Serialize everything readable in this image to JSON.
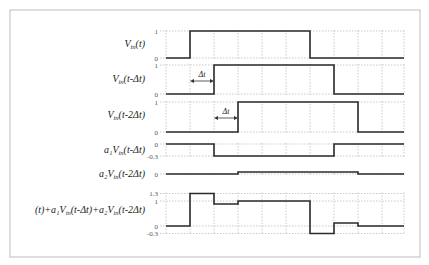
{
  "figure": {
    "frame": {
      "x": 10,
      "y": 10,
      "w": 410,
      "h": 247
    },
    "grid_x": [
      166,
      190,
      214,
      238,
      262,
      286,
      310,
      334,
      358,
      382,
      404
    ],
    "x_start": 166,
    "x_end": 404,
    "step_width": 24,
    "delta_t_label": "Δt"
  },
  "signals": [
    {
      "name": "vin-t",
      "label": {
        "prefix": "",
        "main": "V",
        "sub": "in",
        "rest": "(t)"
      },
      "label_y": 47,
      "ticks": [
        {
          "text": "1",
          "value": 1
        },
        {
          "text": "0",
          "value": 0
        }
      ],
      "y_map": {
        "v1": 1,
        "y1": 31,
        "v0": 0,
        "y0": 58
      },
      "points": [
        [
          166,
          0
        ],
        [
          190,
          0
        ],
        [
          190,
          1
        ],
        [
          310,
          1
        ],
        [
          310,
          0
        ],
        [
          404,
          0
        ]
      ]
    },
    {
      "name": "vin-t-minus-dt",
      "label": {
        "prefix": "",
        "main": "V",
        "sub": "in",
        "rest": "(t-Δt)"
      },
      "label_y": 82,
      "ticks": [
        {
          "text": "1",
          "value": 1
        },
        {
          "text": "0",
          "value": 0
        }
      ],
      "y_map": {
        "v1": 1,
        "y1": 65,
        "v0": 0,
        "y0": 94
      },
      "points": [
        [
          166,
          0
        ],
        [
          214,
          0
        ],
        [
          214,
          1
        ],
        [
          334,
          1
        ],
        [
          334,
          0
        ],
        [
          404,
          0
        ]
      ],
      "delta_arrow": {
        "x1": 190,
        "x2": 214,
        "y": 81,
        "label_y": 77
      }
    },
    {
      "name": "vin-t-minus-2dt",
      "label": {
        "prefix": "",
        "main": "V",
        "sub": "in",
        "rest": "(t-2Δt)"
      },
      "label_y": 118,
      "ticks": [
        {
          "text": "1",
          "value": 1
        },
        {
          "text": "0",
          "value": 0
        }
      ],
      "y_map": {
        "v1": 1,
        "y1": 102,
        "v0": 0,
        "y0": 132
      },
      "points": [
        [
          166,
          0
        ],
        [
          238,
          0
        ],
        [
          238,
          1
        ],
        [
          358,
          1
        ],
        [
          358,
          0
        ],
        [
          404,
          0
        ]
      ],
      "delta_arrow": {
        "x1": 214,
        "x2": 238,
        "y": 118,
        "label_y": 114
      }
    },
    {
      "name": "a1-vin-t-minus-dt",
      "label": {
        "prefix": "a₁",
        "main": "V",
        "sub": "in",
        "rest": "(t-Δt)"
      },
      "label_y": 153,
      "ticks": [
        {
          "text": "0",
          "value": 0
        },
        {
          "text": "-0.3",
          "value": -0.3
        }
      ],
      "y_map": {
        "v1": 0,
        "y1": 144,
        "v0": -0.3,
        "y0": 156
      },
      "points": [
        [
          166,
          0
        ],
        [
          214,
          0
        ],
        [
          214,
          -0.3
        ],
        [
          334,
          -0.3
        ],
        [
          334,
          0
        ],
        [
          404,
          0
        ]
      ]
    },
    {
      "name": "a2-vin-t-minus-2dt",
      "label": {
        "prefix": "a₂",
        "main": "V",
        "sub": "in",
        "rest": "(t-2Δt)"
      },
      "label_y": 177,
      "ticks": [
        {
          "text": "0",
          "value": 0
        }
      ],
      "y_map": {
        "v1": 0.1,
        "y1": 170,
        "v0": 0,
        "y0": 174
      },
      "points": [
        [
          166,
          0
        ],
        [
          238,
          0
        ],
        [
          238,
          0.05
        ],
        [
          358,
          0.05
        ],
        [
          358,
          0
        ],
        [
          404,
          0
        ]
      ]
    },
    {
      "name": "sum-output",
      "label": {
        "prefix": "(t)+a₁",
        "main": "V",
        "sub": "in",
        "rest": "(t-Δt)+a₂V",
        "sub2": "in",
        "rest2": "(t-2Δt)"
      },
      "label_y": 213,
      "ticks": [
        {
          "text": "1.3",
          "value": 1.3
        },
        {
          "text": "1",
          "value": 1
        },
        {
          "text": "0",
          "value": 0
        },
        {
          "text": "-0.3",
          "value": -0.3
        }
      ],
      "y_map": {
        "v1": 1,
        "y1": 201,
        "v0": 0,
        "y0": 226
      },
      "points": [
        [
          166,
          0
        ],
        [
          190,
          0
        ],
        [
          190,
          1.3
        ],
        [
          214,
          1.3
        ],
        [
          214,
          0.88
        ],
        [
          238,
          0.88
        ],
        [
          238,
          1.0
        ],
        [
          310,
          1.0
        ],
        [
          310,
          -0.3
        ],
        [
          334,
          -0.3
        ],
        [
          334,
          0.12
        ],
        [
          358,
          0.12
        ],
        [
          358,
          0
        ],
        [
          404,
          0
        ]
      ]
    }
  ]
}
